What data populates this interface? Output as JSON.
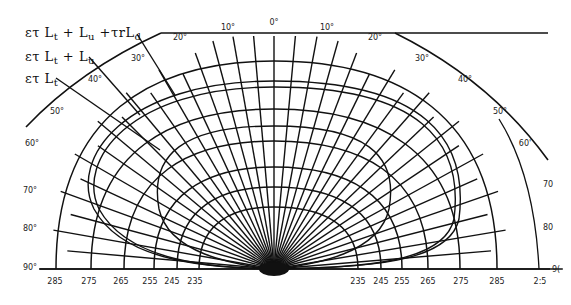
{
  "diagram": {
    "title": "",
    "center": {
      "x": 274,
      "y": 269
    },
    "baseline_y": 269,
    "colors": {
      "line": "#111111",
      "background": "#ffffff"
    },
    "legend": [
      {
        "id": "curve-total",
        "parts": [
          "ετ L",
          "t",
          " + L",
          "u",
          " +τrL",
          "d"
        ],
        "label": "ετ Lt + Lu +τrLd"
      },
      {
        "id": "curve-surface-upwelling",
        "parts": [
          "ετ L",
          "t",
          " + L",
          "u"
        ],
        "label": "ετ Lt + Lu"
      },
      {
        "id": "curve-surface",
        "parts": [
          "ετ L",
          "t"
        ],
        "label": "ετ Lt"
      }
    ],
    "angle_labels_left": [
      "10°",
      "20°",
      "30°",
      "40°",
      "50°",
      "60°",
      "70°",
      "80°",
      "90°"
    ],
    "angle_labels_right": [
      "10°",
      "20°",
      "30°",
      "40°",
      "50°",
      "60'",
      "70",
      "80",
      "9("
    ],
    "zenith_label": "0°",
    "ring_labels_left": [
      "285",
      "275",
      "265",
      "255",
      "245",
      "235"
    ],
    "ring_labels_right": [
      "235",
      "245",
      "255",
      "265",
      "275",
      "285",
      "2:5"
    ],
    "ring_values": [
      235,
      245,
      255,
      265,
      275,
      285,
      295
    ]
  }
}
